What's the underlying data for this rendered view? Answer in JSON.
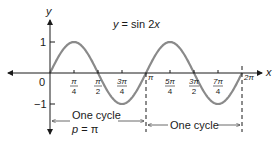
{
  "chart_data": {
    "type": "line",
    "title": "y = sin 2x",
    "title_parts": {
      "lhs": "y",
      "eq": " = sin 2",
      "var": "x"
    },
    "xlabel": "x",
    "ylabel": "y",
    "function": "sin(2x)",
    "xlim": [
      0,
      6.2832
    ],
    "ylim": [
      -1,
      1
    ],
    "grid": false,
    "x_ticks": [
      {
        "value": 0,
        "label": "0"
      },
      {
        "value": 0.7854,
        "num": "π",
        "den": "4"
      },
      {
        "value": 1.5708,
        "num": "π",
        "den": "2"
      },
      {
        "value": 2.3562,
        "num": "3π",
        "den": "4"
      },
      {
        "value": 3.1416,
        "label": "π"
      },
      {
        "value": 3.927,
        "num": "5π",
        "den": "4"
      },
      {
        "value": 4.7124,
        "num": "3π",
        "den": "2"
      },
      {
        "value": 5.4978,
        "num": "7π",
        "den": "4"
      },
      {
        "value": 6.2832,
        "label": "2π"
      }
    ],
    "y_ticks": [
      {
        "value": 1,
        "label": "1"
      },
      {
        "value": -1,
        "label": "−1"
      }
    ],
    "series": [
      {
        "name": "y = sin 2x",
        "x": [
          0,
          0.7854,
          1.5708,
          2.3562,
          3.1416,
          3.927,
          4.7124,
          5.4978,
          6.2832
        ],
        "y": [
          0,
          1,
          0,
          -1,
          0,
          1,
          0,
          -1,
          0
        ]
      }
    ],
    "annotations": [
      {
        "text": "One cycle",
        "sub": "p = π",
        "from": 0,
        "to": 3.1416
      },
      {
        "text": "One cycle",
        "from": 3.1416,
        "to": 6.2832
      }
    ],
    "dashed_lines_at_x": [
      3.1416,
      6.2832
    ]
  },
  "labels": {
    "title_lhs": "y",
    "title_eq": " = sin 2",
    "title_var": "x",
    "x_axis": "x",
    "y_axis": "y",
    "origin": "0",
    "y_one": "1",
    "y_neg_one": "−1",
    "cycle1": "One cycle",
    "cycle1_p": "p",
    "cycle1_eq": " = π",
    "cycle2": "One cycle",
    "pi": "π",
    "two_pi": "2π",
    "t1_num": "π",
    "t1_den": "4",
    "t2_num": "π",
    "t2_den": "2",
    "t3_num": "3π",
    "t3_den": "4",
    "t5_num": "5π",
    "t5_den": "4",
    "t6_num": "3π",
    "t6_den": "2",
    "t7_num": "7π",
    "t7_den": "4"
  },
  "colors": {
    "curve": "#8a8a8a",
    "axis": "#1a1a1a",
    "text": "#1a1a1a"
  }
}
